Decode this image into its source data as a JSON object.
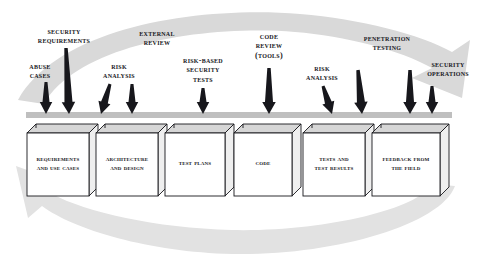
{
  "figure": {
    "type": "process-diagram",
    "background_color": "#ffffff",
    "ink_color": "#17171c",
    "swoosh_color": "#d9d9d9",
    "bar_color": "#bfbfbf",
    "box_face_color": "#ffffff",
    "box_top_color": "#d6d6d6",
    "box_side_color": "#efefef"
  },
  "touchpoints": [
    {
      "id": "abuse-cases",
      "label": "Abuse\nCases",
      "label_x": 40,
      "label_y": 62,
      "arrow_x": 46,
      "arrow_tip_y": 114,
      "arrow_top_y": 82,
      "slant": 0,
      "width": 7
    },
    {
      "id": "security-requirements",
      "label": "Security\nRequirements",
      "label_x": 64,
      "label_y": 27,
      "arrow_x": 69,
      "arrow_tip_y": 114,
      "arrow_top_y": 48,
      "slant": -3,
      "width": 8
    },
    {
      "id": "risk-analysis-1",
      "label": "Risk\nAnalysis",
      "label_x": 119,
      "label_y": 62,
      "arrow_x": 101,
      "arrow_tip_y": 114,
      "arrow_top_y": 84,
      "slant": 9,
      "width": 7
    },
    {
      "id": "external-review",
      "label": "External\nReview",
      "label_x": 157,
      "label_y": 29,
      "arrow_x": 132,
      "arrow_tip_y": 114,
      "arrow_top_y": 84,
      "slant": 0,
      "width": 7
    },
    {
      "id": "risk-based-security-tests",
      "label": "Risk-based\nSecurity\nTests",
      "label_x": 203,
      "label_y": 56,
      "arrow_x": 203,
      "arrow_tip_y": 114,
      "arrow_top_y": 88,
      "slant": 0,
      "width": 7
    },
    {
      "id": "code-review-tools",
      "label": "Code\nReview\n(Tools)",
      "label_x": 269,
      "label_y": 32,
      "arrow_x": 269,
      "arrow_tip_y": 114,
      "arrow_top_y": 68,
      "slant": 0,
      "width": 8
    },
    {
      "id": "risk-analysis-2",
      "label": "Risk\nAnalysis",
      "label_x": 322,
      "label_y": 64,
      "arrow_x": 332,
      "arrow_tip_y": 114,
      "arrow_top_y": 86,
      "slant": -9,
      "width": 7
    },
    {
      "id": "penetration-testing",
      "label": "Penetration\nTesting",
      "label_x": 387,
      "label_y": 34,
      "arrow_x": 362,
      "arrow_tip_y": 114,
      "arrow_top_y": 70,
      "slant": -4,
      "width": 8
    },
    {
      "id": "risk-analysis-3",
      "label": "",
      "label_x": 0,
      "label_y": 0,
      "arrow_x": 410,
      "arrow_tip_y": 114,
      "arrow_top_y": 70,
      "slant": 0,
      "width": 8
    },
    {
      "id": "security-operations",
      "label": "Security\nOperations",
      "label_x": 448,
      "label_y": 60,
      "arrow_x": 432,
      "arrow_tip_y": 114,
      "arrow_top_y": 86,
      "slant": 0,
      "width": 7
    }
  ],
  "artifacts": [
    {
      "id": "requirements-and-use-cases",
      "label": "Requirements\nand Use Cases",
      "x": 27,
      "width": 62
    },
    {
      "id": "architecture-and-design",
      "label": "Architecture\nand Design",
      "x": 96,
      "width": 62
    },
    {
      "id": "test-plans",
      "label": "Test Plans",
      "x": 165,
      "width": 60
    },
    {
      "id": "code",
      "label": "Code",
      "x": 234,
      "width": 58
    },
    {
      "id": "tests-and-test-results",
      "label": "Tests and\nTest Results",
      "x": 303,
      "width": 62
    },
    {
      "id": "feedback-from-the-field",
      "label": "Feedback from\nthe Field",
      "x": 372,
      "width": 68
    }
  ],
  "flow": {
    "forward_label": "forward process flow",
    "feedback_label": "feedback loop to requirements"
  }
}
